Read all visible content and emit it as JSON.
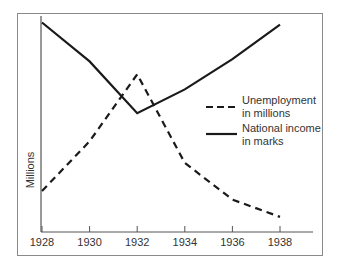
{
  "chart_data": {
    "type": "line",
    "title": "",
    "xlabel": "",
    "ylabel": "Millions",
    "x": [
      1928,
      1930,
      1932,
      1934,
      1936,
      1938
    ],
    "x_tick_labels": [
      "1928",
      "1930",
      "1932",
      "1934",
      "1936",
      "1938"
    ],
    "y_ticks_shown": false,
    "ylim": [
      0,
      10
    ],
    "y_scale_note": "relative (no numeric y ticks shown)",
    "grid": false,
    "legend_position": "right-center",
    "series": [
      {
        "name": "Unemployment in millions",
        "style": "dashed",
        "color": "#1a1a1a",
        "values": [
          1.9,
          4.2,
          7.3,
          3.2,
          1.5,
          0.7
        ]
      },
      {
        "name": "National income in marks",
        "style": "solid",
        "color": "#1a1a1a",
        "values": [
          9.7,
          7.9,
          5.5,
          6.6,
          8.0,
          9.6
        ]
      }
    ]
  },
  "legend": {
    "unemployment": {
      "line1": "Unemployment",
      "line2": "in millions"
    },
    "income": {
      "line1": "National income",
      "line2": "in marks"
    }
  },
  "axis": {
    "y_title": "Millions"
  }
}
